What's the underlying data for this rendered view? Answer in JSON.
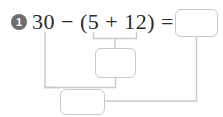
{
  "worksheet": {
    "problem_number": "1",
    "equation": "30 − (5 + 12) =",
    "equation_parts": {
      "minuend": "30",
      "operator_outer": "−",
      "open_paren": "(",
      "addend_1": "5",
      "operator_inner": "+",
      "addend_2": "12",
      "close_paren": ")",
      "equals": "="
    },
    "answer_boxes": [
      {
        "id": "box-answer",
        "value": "",
        "role": "final-answer"
      },
      {
        "id": "box-middle",
        "value": "",
        "role": "parenthesis-sum"
      },
      {
        "id": "box-bottom",
        "value": "",
        "role": "subtraction-result"
      }
    ],
    "colors": {
      "badge_fill": "#6e6e6e",
      "badge_text": "#ffffff",
      "equation_text": "#2b2b2b",
      "box_border": "#c9c9c9",
      "connector_line": "#c9c9c9",
      "background": "#ffffff"
    }
  }
}
